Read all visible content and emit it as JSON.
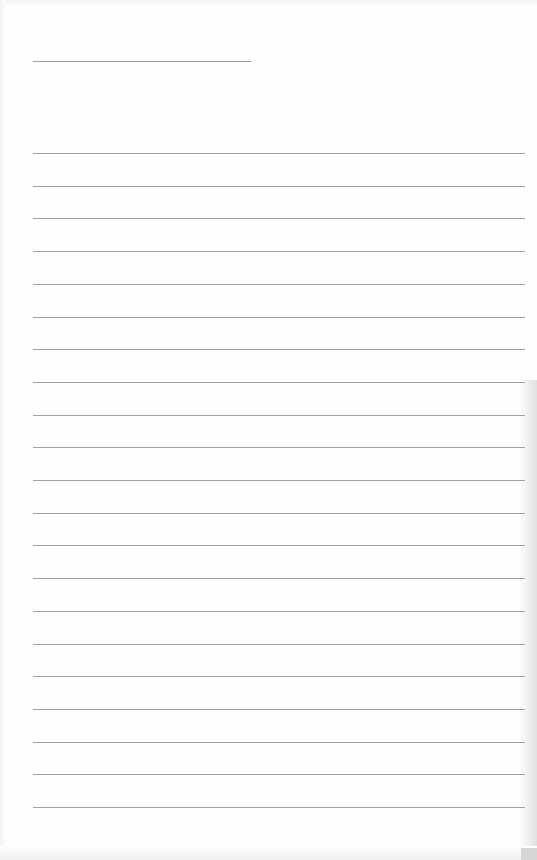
{
  "document": {
    "type": "blank lined writing page",
    "title_line": {
      "present": true,
      "text": ""
    },
    "ruled_lines": {
      "count": 21,
      "first_y": 153,
      "spacing": 32.7,
      "entries": [
        "",
        "",
        "",
        "",
        "",
        "",
        "",
        "",
        "",
        "",
        "",
        "",
        "",
        "",
        "",
        "",
        "",
        "",
        "",
        "",
        ""
      ]
    },
    "colors": {
      "paper": "#fefefe",
      "line": "#a2a2a2"
    }
  }
}
